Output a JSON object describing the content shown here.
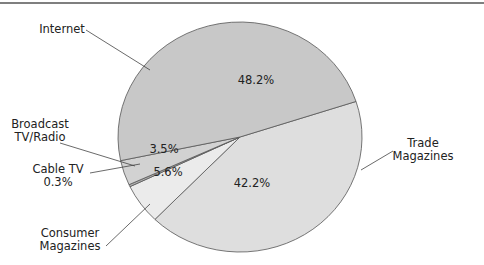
{
  "chart_data": {
    "type": "pie",
    "title": "",
    "slices": [
      {
        "name": "Internet",
        "label_lines": [
          "Internet"
        ],
        "value": 48.2,
        "pct_label": "48.2%",
        "color": "#c8c8c8"
      },
      {
        "name": "Trade Magazines",
        "label_lines": [
          "Trade",
          "Magazines"
        ],
        "value": 42.2,
        "pct_label": "42.2%",
        "color": "#dedede"
      },
      {
        "name": "Consumer Magazines",
        "label_lines": [
          "Consumer",
          "Magazines"
        ],
        "value": 5.6,
        "pct_label": "5.6%",
        "color": "#ebebeb"
      },
      {
        "name": "Cable TV",
        "label_lines": [
          "Cable TV",
          "0.3%"
        ],
        "value": 0.3,
        "pct_label": "",
        "color": "#b0b0b0"
      },
      {
        "name": "Broadcast TV/Radio",
        "label_lines": [
          "Broadcast",
          "TV/Radio"
        ],
        "value": 3.5,
        "pct_label": "3.5%",
        "color": "#d2d2d2"
      }
    ],
    "legend": "none"
  }
}
